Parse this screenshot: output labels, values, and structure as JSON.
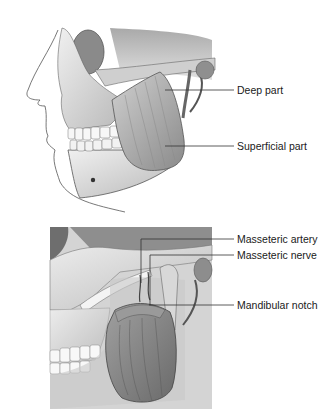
{
  "figures": [
    {
      "id": "top",
      "description": "Lateral view of skull with masseter muscle",
      "labels": [
        {
          "text": "Deep part"
        },
        {
          "text": "Superficial part"
        }
      ]
    },
    {
      "id": "bottom",
      "description": "Masseter reflected showing vessels and nerve",
      "labels": [
        {
          "text": "Masseteric artery"
        },
        {
          "text": "Masseteric nerve"
        },
        {
          "text": "Mandibular notch"
        }
      ]
    }
  ],
  "colors": {
    "bone_light": "#e6e6e6",
    "bone_mid": "#bdbdbd",
    "bone_dark": "#7a7a7a",
    "muscle": "#a8a8a8",
    "muscle_dark": "#6f6f6f",
    "leader_line": "#333333",
    "outline": "#555555"
  }
}
